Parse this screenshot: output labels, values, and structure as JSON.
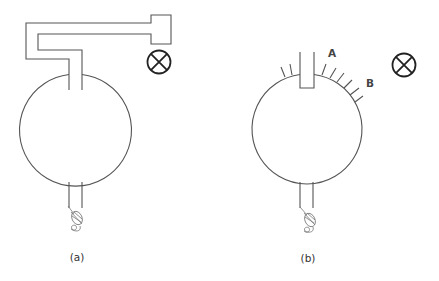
{
  "figure": {
    "panels": [
      {
        "id": "a",
        "caption": "(a)",
        "description": "Globe with bent tube connected to closed end block, indicator lamp"
      },
      {
        "id": "b",
        "caption": "(b)",
        "description": "Globe with open stub and row of small side tubes, indicator lamp"
      }
    ],
    "point_labels": {
      "A": "A",
      "B": "B"
    },
    "icons": [
      "lamp-cross-icon",
      "lamp-cross-icon",
      "filament-coil-icon",
      "filament-coil-icon"
    ],
    "colors": {
      "line": "#555555",
      "lamp": "#222222",
      "background": "#ffffff"
    }
  }
}
